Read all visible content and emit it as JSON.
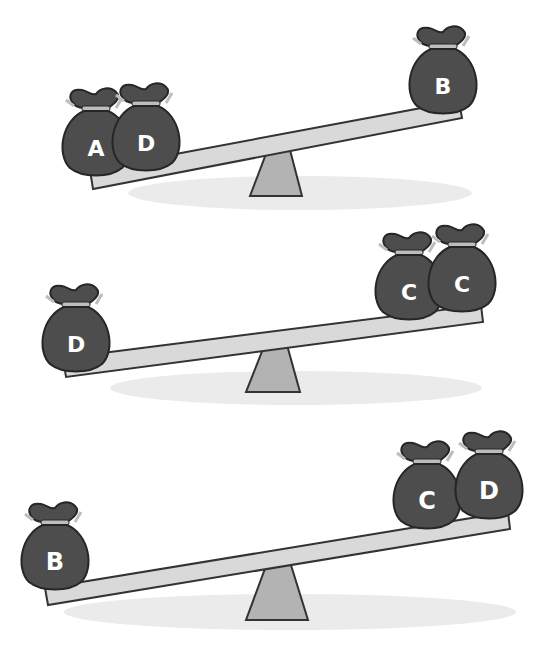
{
  "figure": {
    "colors": {
      "bag_fill": "#4d4d4d",
      "bag_outline": "#262626",
      "bag_tie": "#bdbdbd",
      "letter": "#ffffff",
      "plank_fill": "#d9d9d9",
      "plank_outline": "#333333",
      "fulcrum_fill": "#b3b3b3",
      "shadow_fill": "#ebebeb",
      "background": "#ffffff"
    },
    "seesaws": [
      {
        "id": 1,
        "heavier_side": "left",
        "left_bags": [
          "A",
          "D"
        ],
        "right_bags": [
          "B"
        ]
      },
      {
        "id": 2,
        "heavier_side": "left",
        "left_bags": [
          "D"
        ],
        "right_bags": [
          "C",
          "C"
        ]
      },
      {
        "id": 3,
        "heavier_side": "left",
        "left_bags": [
          "B"
        ],
        "right_bags": [
          "C",
          "D"
        ]
      }
    ]
  }
}
